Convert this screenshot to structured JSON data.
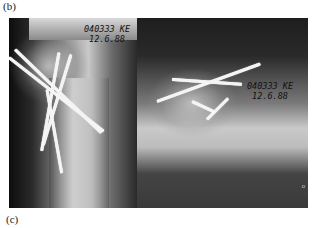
{
  "figure": {
    "panel_labels": {
      "top": "(b)",
      "bottom": "(c)"
    },
    "images": [
      {
        "name": "xray-shoulder-ap",
        "stamp_line1": "040333  KE",
        "stamp_line2": "12.6.88",
        "description": "Radiograph of proximal humerus fixed with multiple crossing K-wires"
      },
      {
        "name": "xray-shoulder-lateral",
        "stamp_line1": "040333  KE",
        "stamp_line2": "12.6.88",
        "marker": "o",
        "description": "Axial/lateral radiograph of humeral head with K-wires"
      }
    ]
  }
}
